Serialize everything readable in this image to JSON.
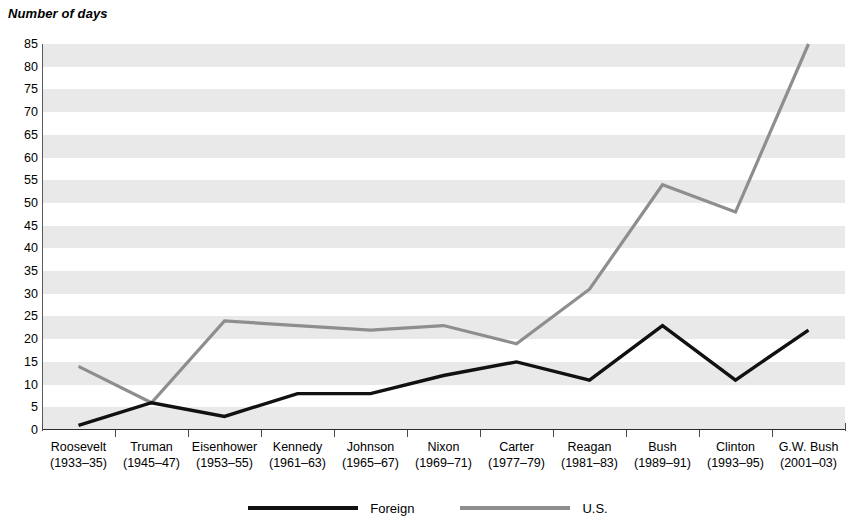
{
  "chart_data": {
    "type": "line",
    "title": "Number of days",
    "xlabel": "",
    "ylabel": "Number of days",
    "ylim": [
      0,
      85
    ],
    "ytick_step": 5,
    "yticks": [
      85,
      80,
      75,
      70,
      65,
      60,
      55,
      50,
      45,
      40,
      35,
      30,
      25,
      20,
      15,
      10,
      5,
      0
    ],
    "grid": "alternating horizontal bands, every 5 units",
    "legend_position": "bottom-center",
    "categories": [
      "Roosevelt\n(1933–35)",
      "Truman\n(1945–47)",
      "Eisenhower\n(1953–55)",
      "Kennedy\n(1961–63)",
      "Johnson\n(1965–67)",
      "Nixon\n(1969–71)",
      "Carter\n(1977–79)",
      "Reagan\n(1981–83)",
      "Bush\n(1989–91)",
      "Clinton\n(1993–95)",
      "G.W. Bush\n(2001–03)"
    ],
    "series": [
      {
        "name": "Foreign",
        "color": "#111111",
        "values": [
          1,
          6,
          3,
          8,
          8,
          12,
          15,
          11,
          23,
          11,
          22
        ]
      },
      {
        "name": "U.S.",
        "color": "#8e8e8e",
        "values": [
          14,
          6,
          24,
          23,
          22,
          23,
          19,
          31,
          54,
          48,
          85
        ]
      }
    ]
  },
  "axis": {
    "title": "Number of days",
    "ytick_labels": [
      "85",
      "80",
      "75",
      "70",
      "65",
      "60",
      "55",
      "50",
      "45",
      "40",
      "35",
      "30",
      "25",
      "20",
      "15",
      "10",
      "5",
      "0"
    ],
    "xtick_labels": [
      {
        "name": "Roosevelt",
        "years": "(1933–35)"
      },
      {
        "name": "Truman",
        "years": "(1945–47)"
      },
      {
        "name": "Eisenhower",
        "years": "(1953–55)"
      },
      {
        "name": "Kennedy",
        "years": "(1961–63)"
      },
      {
        "name": "Johnson",
        "years": "(1965–67)"
      },
      {
        "name": "Nixon",
        "years": "(1969–71)"
      },
      {
        "name": "Carter",
        "years": "(1977–79)"
      },
      {
        "name": "Reagan",
        "years": "(1981–83)"
      },
      {
        "name": "Bush",
        "years": "(1989–91)"
      },
      {
        "name": "Clinton",
        "years": "(1993–95)"
      },
      {
        "name": "G.W. Bush",
        "years": "(2001–03)"
      }
    ]
  },
  "legend": {
    "entries": [
      {
        "label": "Foreign",
        "color": "#111111",
        "icon": "line-swatch-black"
      },
      {
        "label": "U.S.",
        "color": "#8e8e8e",
        "icon": "line-swatch-gray"
      }
    ]
  },
  "colors": {
    "foreign": "#111111",
    "us": "#8e8e8e",
    "band": "#e9e9e9",
    "background": "#ffffff",
    "axis": "#2b2b2b"
  }
}
